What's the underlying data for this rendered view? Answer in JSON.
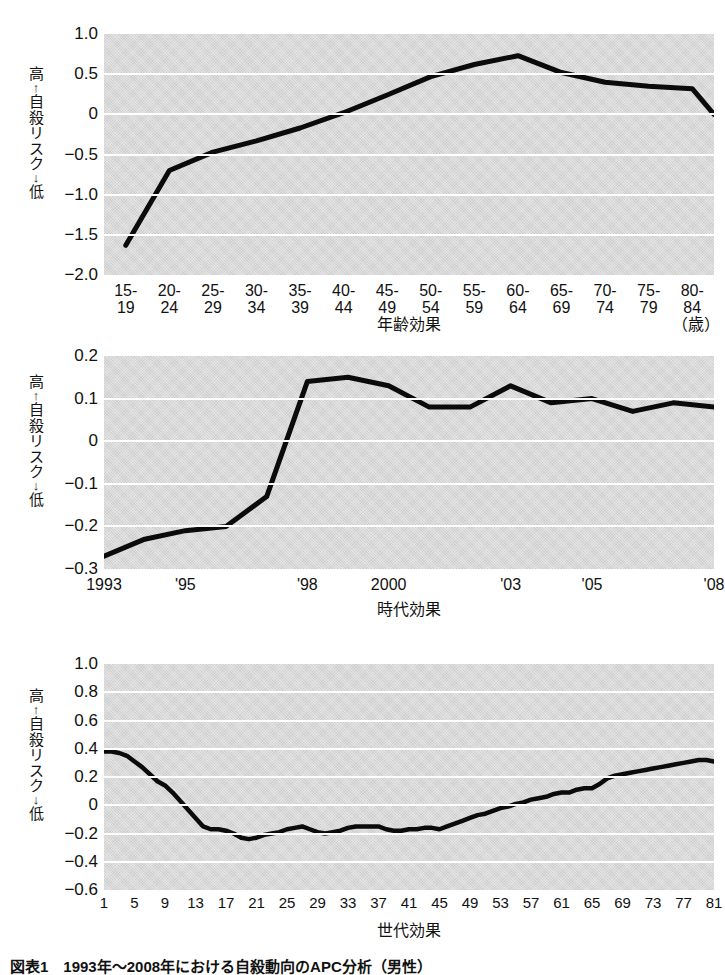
{
  "figure": {
    "caption": "図表1　1993年～2008年における自殺動向のAPC分析（男性）",
    "axis_label_vertical": [
      "高",
      "↑",
      "自",
      "殺",
      "リ",
      "ス",
      "ク",
      "↓",
      "低"
    ],
    "line_color": "#0b0b0b",
    "plot_background": "#d9d9d9",
    "gridline_color": "#ffffff"
  },
  "chart_data": [
    {
      "type": "line",
      "title": "",
      "xlabel": "年齢効果",
      "ylabel": "高↑自殺リスク↓低",
      "unit_note": "（歳）",
      "categories": [
        "15-\n19",
        "20-\n24",
        "25-\n29",
        "30-\n34",
        "35-\n39",
        "40-\n44",
        "45-\n49",
        "50-\n54",
        "55-\n59",
        "60-\n64",
        "65-\n69",
        "70-\n74",
        "75-\n79",
        "80-\n84"
      ],
      "values": [
        -1.63,
        -0.7,
        -0.47,
        -0.33,
        -0.17,
        0.02,
        0.24,
        0.47,
        0.62,
        0.73,
        0.52,
        0.4,
        0.35,
        0.32,
        0.0
      ],
      "x": [
        1,
        2,
        3,
        4,
        5,
        6,
        7,
        8,
        9,
        10,
        11,
        12,
        13,
        14
      ],
      "series": [
        {
          "name": "年齢効果",
          "values": [
            -1.63,
            -0.7,
            -0.47,
            -0.3,
            -0.13,
            0.08,
            0.3,
            0.52,
            0.67,
            0.73,
            0.5,
            0.4,
            0.35,
            0.32
          ]
        }
      ],
      "ylim": [
        -2.0,
        1.0
      ],
      "yticks": [
        "1.0",
        "0.5",
        "0",
        "-0.5",
        "-1.0",
        "-1.5",
        "-2.0"
      ],
      "ytick_values": [
        1.0,
        0.5,
        0,
        -0.5,
        -1.0,
        -1.5,
        -2.0
      ],
      "grid": true,
      "legend": "none"
    },
    {
      "type": "line",
      "title": "",
      "xlabel": "時代効果",
      "ylabel": "高↑自殺リスク↓低",
      "categories": [
        "1993",
        "1994",
        "1995",
        "1996",
        "1997",
        "1998",
        "1999",
        "2000",
        "2001",
        "2002",
        "2003",
        "2004",
        "2005",
        "2006",
        "2007",
        "2008"
      ],
      "xtick_labels": [
        "1993",
        "'95",
        "'98",
        "2000",
        "'03",
        "'05",
        "'08"
      ],
      "xtick_values": [
        1993,
        1995,
        1998,
        2000,
        2003,
        2005,
        2008
      ],
      "values": [
        -0.27,
        -0.23,
        -0.21,
        -0.2,
        -0.13,
        0.14,
        0.15,
        0.13,
        0.08,
        0.08,
        0.13,
        0.09,
        0.1,
        0.07,
        0.09,
        0.08
      ],
      "series": [
        {
          "name": "時代効果",
          "values": [
            -0.27,
            -0.23,
            -0.21,
            -0.2,
            -0.13,
            0.14,
            0.15,
            0.13,
            0.08,
            0.08,
            0.13,
            0.09,
            0.1,
            0.07,
            0.09,
            0.08
          ]
        }
      ],
      "ylim": [
        -0.3,
        0.2
      ],
      "yticks": [
        "0.2",
        "0.1",
        "0",
        "-0.1",
        "-0.2",
        "-0.3"
      ],
      "ytick_values": [
        0.2,
        0.1,
        0,
        -0.1,
        -0.2,
        -0.3
      ],
      "grid": true,
      "legend": "none"
    },
    {
      "type": "line",
      "title": "",
      "xlabel": "世代効果",
      "ylabel": "高↑自殺リスク↓低",
      "xtick_labels": [
        "1",
        "5",
        "9",
        "13",
        "17",
        "21",
        "25",
        "29",
        "33",
        "37",
        "41",
        "45",
        "49",
        "53",
        "57",
        "61",
        "65",
        "69",
        "73",
        "77",
        "81"
      ],
      "xtick_values": [
        1,
        5,
        9,
        13,
        17,
        21,
        25,
        29,
        33,
        37,
        41,
        45,
        49,
        53,
        57,
        61,
        65,
        69,
        73,
        77,
        81
      ],
      "x": [
        1,
        2,
        3,
        4,
        5,
        6,
        7,
        8,
        9,
        10,
        11,
        12,
        13,
        14,
        15,
        16,
        17,
        18,
        19,
        20,
        21,
        22,
        23,
        24,
        25,
        26,
        27,
        28,
        29,
        30,
        31,
        32,
        33,
        34,
        35,
        36,
        37,
        38,
        39,
        40,
        41,
        42,
        43,
        44,
        45,
        46,
        47,
        48,
        49,
        50,
        51,
        52,
        53,
        54,
        55,
        56,
        57,
        58,
        59,
        60,
        61,
        62,
        63,
        64,
        65,
        66,
        67,
        68,
        69,
        70,
        71,
        72,
        73,
        74,
        75,
        76,
        77,
        78,
        79,
        80,
        81
      ],
      "values": [
        0.38,
        0.38,
        0.37,
        0.35,
        0.31,
        0.27,
        0.22,
        0.17,
        0.14,
        0.09,
        0.03,
        -0.03,
        -0.09,
        -0.15,
        -0.17,
        -0.17,
        -0.18,
        -0.2,
        -0.23,
        -0.24,
        -0.23,
        -0.21,
        -0.2,
        -0.19,
        -0.17,
        -0.16,
        -0.15,
        -0.17,
        -0.19,
        -0.2,
        -0.19,
        -0.18,
        -0.16,
        -0.15,
        -0.15,
        -0.15,
        -0.15,
        -0.17,
        -0.18,
        -0.18,
        -0.17,
        -0.17,
        -0.16,
        -0.16,
        -0.17,
        -0.15,
        -0.13,
        -0.11,
        -0.09,
        -0.07,
        -0.06,
        -0.04,
        -0.02,
        -0.01,
        0.01,
        0.02,
        0.04,
        0.05,
        0.06,
        0.08,
        0.09,
        0.09,
        0.11,
        0.12,
        0.12,
        0.15,
        0.19,
        0.21,
        0.22,
        0.23,
        0.24,
        0.25,
        0.26,
        0.27,
        0.28,
        0.29,
        0.3,
        0.31,
        0.32,
        0.32,
        0.31
      ],
      "series": [
        {
          "name": "世代効果",
          "values": [
            0.38,
            0.38,
            0.37,
            0.35,
            0.31,
            0.27,
            0.22,
            0.17,
            0.14,
            0.09,
            0.03,
            -0.03,
            -0.09,
            -0.15,
            -0.17,
            -0.17,
            -0.18,
            -0.2,
            -0.23,
            -0.24,
            -0.23,
            -0.21,
            -0.2,
            -0.19,
            -0.17,
            -0.16,
            -0.15,
            -0.17,
            -0.19,
            -0.2,
            -0.19,
            -0.18,
            -0.16,
            -0.15,
            -0.15,
            -0.15,
            -0.15,
            -0.17,
            -0.18,
            -0.18,
            -0.17,
            -0.17,
            -0.16,
            -0.16,
            -0.17,
            -0.15,
            -0.13,
            -0.11,
            -0.09,
            -0.07,
            -0.06,
            -0.04,
            -0.02,
            -0.01,
            0.01,
            0.02,
            0.04,
            0.05,
            0.06,
            0.08,
            0.09,
            0.09,
            0.11,
            0.12,
            0.12,
            0.15,
            0.19,
            0.21,
            0.22,
            0.23,
            0.24,
            0.25,
            0.26,
            0.27,
            0.28,
            0.29,
            0.3,
            0.31,
            0.32,
            0.32,
            0.31
          ]
        }
      ],
      "ylim": [
        -0.6,
        1.0
      ],
      "yticks": [
        "1.0",
        "0.8",
        "0.6",
        "0.4",
        "0.2",
        "0",
        "-0.2",
        "-0.4",
        "-0.6"
      ],
      "ytick_values": [
        1.0,
        0.8,
        0.6,
        0.4,
        0.2,
        0,
        -0.2,
        -0.4,
        -0.6
      ],
      "grid": true,
      "legend": "none"
    }
  ]
}
